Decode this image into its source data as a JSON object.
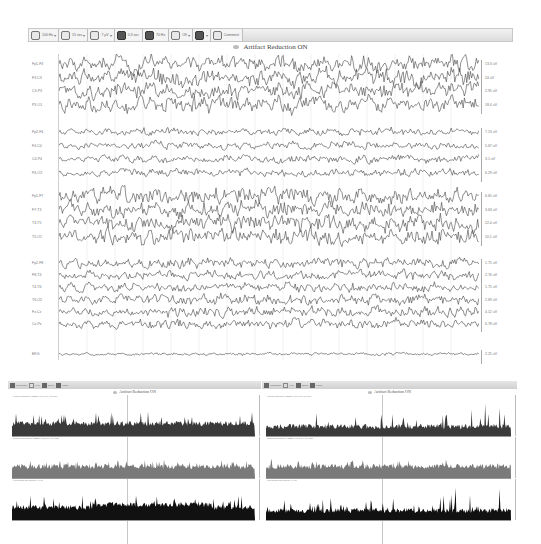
{
  "eeg_window": {
    "toolbar": {
      "items": [
        {
          "icon": "filter-icon",
          "label": "100 Hz",
          "has_dropdown": true
        },
        {
          "icon": "monitor-icon",
          "label": "15 sec",
          "has_dropdown": true
        },
        {
          "icon": "sensitivity-icon",
          "label": "7 µV",
          "has_dropdown": true
        },
        {
          "icon": "timebase-icon",
          "label": "0.3 sec",
          "has_dropdown": false
        },
        {
          "icon": "notch-icon",
          "label": "70 Hz",
          "has_dropdown": false
        },
        {
          "icon": "montage-icon",
          "label": "Off",
          "has_dropdown": true
        },
        {
          "icon": "person-icon",
          "label": "",
          "has_dropdown": true
        },
        {
          "icon": "comment-icon",
          "label": "Comment",
          "has_dropdown": false
        }
      ]
    },
    "title": "Artifact Reduction ON",
    "channel_groups": [
      {
        "channels": [
          {
            "label": "Fp1-F3",
            "amplitude": "13.3 uV"
          },
          {
            "label": "F3-C3",
            "amplitude": "24 uV"
          },
          {
            "label": "C3-P3",
            "amplitude": "2.95 uV"
          },
          {
            "label": "P3-O1",
            "amplitude": "18.4 uV"
          }
        ]
      },
      {
        "channels": [
          {
            "label": "Fp2-F4",
            "amplitude": "7.13 uV"
          },
          {
            "label": "F4-C4",
            "amplitude": "5.67 uV"
          },
          {
            "label": "C4-P4",
            "amplitude": "3.1 uV"
          },
          {
            "label": "P4-O2",
            "amplitude": "6.29 uV"
          }
        ]
      },
      {
        "channels": [
          {
            "label": "Fp1-F7",
            "amplitude": "6.65 uV"
          },
          {
            "label": "F7-T3",
            "amplitude": "3.63 uV"
          },
          {
            "label": "T3-T5",
            "amplitude": "22.4 uV"
          },
          {
            "label": "T5-O1",
            "amplitude": "10.1 uV"
          }
        ]
      },
      {
        "channels": [
          {
            "label": "Fp2-F8",
            "amplitude": "1.75 uV"
          },
          {
            "label": "F8-T4",
            "amplitude": "2.76 uV"
          },
          {
            "label": "T4-T6",
            "amplitude": "1.75 uV"
          },
          {
            "label": "T6-O2",
            "amplitude": "2.69 uV"
          },
          {
            "label": "Fz-Cz",
            "amplitude": "4.12 uV"
          },
          {
            "label": "Cz-Pz",
            "amplitude": "6.78 uV"
          }
        ]
      },
      {
        "channels": [
          {
            "label": "EKG",
            "amplitude": "2.25 uV"
          }
        ]
      }
    ]
  },
  "trend_windows": [
    {
      "position": "left",
      "title": "Artifact Reduction ON",
      "toolbar_items": [
        "Timescale",
        "1 hr",
        "Zoom",
        "Panel"
      ],
      "panels": [
        {
          "label": "Left hemisphere aEEG (Fp1-T3, C3-O1)",
          "fill": "#3a3a3a"
        },
        {
          "label": "Right hemisphere aEEG (Fp2-T4, C4-O2)",
          "fill": "#7a7a7a"
        },
        {
          "label": "Left-Right asymmetry (L-R)",
          "fill": "#111111"
        }
      ]
    },
    {
      "position": "right",
      "title": "Artifact Reduction ON",
      "toolbar_items": [
        "Timescale",
        "1 hr",
        "Zoom",
        "Panel"
      ],
      "panels": [
        {
          "label": "Left hemisphere aEEG (Fp1-T3, C3-O1)",
          "fill": "#3a3a3a"
        },
        {
          "label": "Right hemisphere aEEG (Fp2-T4, C4-O2)",
          "fill": "#7a7a7a"
        },
        {
          "label": "Left-Right asymmetry (L-R)",
          "fill": "#111111"
        }
      ]
    }
  ],
  "colors": {
    "trace": "#444444",
    "gridline": "#e0e0e0",
    "toolbar_bg": "#dcdcdc"
  }
}
